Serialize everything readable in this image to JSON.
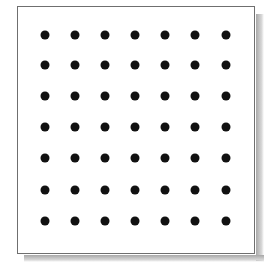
{
  "diagram": {
    "type": "dot-grid",
    "rows": 7,
    "columns": 7,
    "dot_color": "#111111",
    "frame_border_color": "#6f6f6f",
    "background_color": "#ffffff",
    "dot_centers_x": [
      45,
      75,
      105,
      135,
      165,
      195,
      226
    ],
    "dot_centers_y": [
      35,
      65,
      96,
      127,
      158,
      190,
      221
    ]
  }
}
